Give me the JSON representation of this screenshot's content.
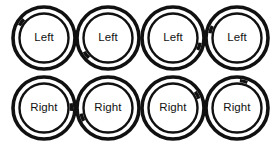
{
  "figure": {
    "background_color": "#ffffff",
    "stroke_color": "#111111",
    "text_color": "#111111",
    "rows": 2,
    "columns": 4
  },
  "rings": [
    {
      "label": "Left",
      "row": 0,
      "col": 0,
      "x": 10,
      "y": 4,
      "tick_angle": 305
    },
    {
      "label": "Left",
      "row": 0,
      "col": 1,
      "x": 74,
      "y": 4,
      "tick_angle": 232
    },
    {
      "label": "Left",
      "row": 0,
      "col": 2,
      "x": 139,
      "y": 4,
      "tick_angle": 108
    },
    {
      "label": "Left",
      "row": 0,
      "col": 3,
      "x": 203,
      "y": 4,
      "tick_angle": 288
    },
    {
      "label": "Right",
      "row": 1,
      "col": 0,
      "x": 10,
      "y": 74,
      "tick_angle": 88
    },
    {
      "label": "Right",
      "row": 1,
      "col": 1,
      "x": 74,
      "y": 74,
      "tick_angle": 250
    },
    {
      "label": "Right",
      "row": 1,
      "col": 2,
      "x": 139,
      "y": 74,
      "tick_angle": 62
    },
    {
      "label": "Right",
      "row": 1,
      "col": 3,
      "x": 203,
      "y": 74,
      "tick_angle": 14
    }
  ],
  "geometry": {
    "cell_size": 68,
    "outer_radius": 31,
    "outer_stroke": 3.6,
    "inner_radius": 24.5,
    "inner_stroke": 2.4,
    "tick_radius": 27.5,
    "tick_stroke": 3.4,
    "tick_arc_degrees": 16
  }
}
